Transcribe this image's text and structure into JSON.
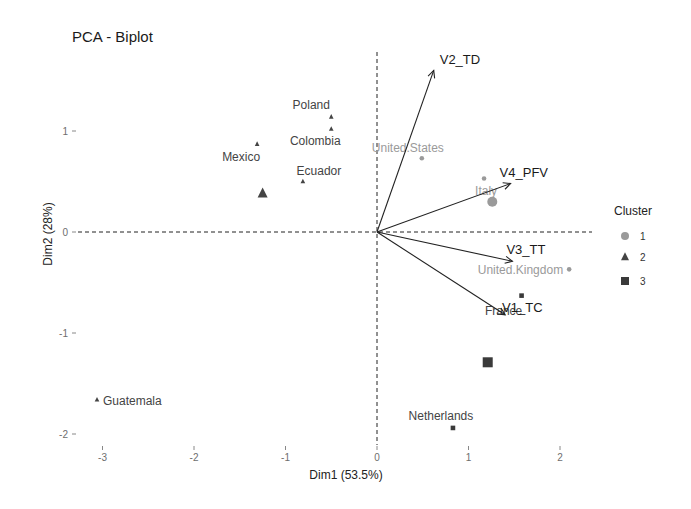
{
  "chart_data": {
    "type": "scatter",
    "title": "PCA - Biplot",
    "xlabel": "Dim1 (53.5%)",
    "ylabel": "Dim2 (28%)",
    "xlim": [
      -3.2,
      2.5
    ],
    "ylim": [
      -2.1,
      1.8
    ],
    "x_ticks": [
      -3,
      -2,
      -1,
      0,
      1,
      2
    ],
    "y_ticks": [
      -2,
      -1,
      0,
      1
    ],
    "grid": false,
    "legend": {
      "title": "Cluster",
      "position": "right",
      "entries": [
        {
          "label": "1",
          "shape": "circle",
          "color": "#9a9a9a"
        },
        {
          "label": "2",
          "shape": "triangle",
          "color": "#444444"
        },
        {
          "label": "3",
          "shape": "square",
          "color": "#3a3a3a"
        }
      ]
    },
    "points": [
      {
        "label": "Poland",
        "x": -0.5,
        "y": 1.14,
        "cluster": 2
      },
      {
        "label": "Colombia",
        "x": -0.5,
        "y": 1.02,
        "cluster": 2
      },
      {
        "label": "Mexico",
        "x": -1.31,
        "y": 0.87,
        "cluster": 2
      },
      {
        "label": "Ecuador",
        "x": -0.81,
        "y": 0.5,
        "cluster": 2
      },
      {
        "label": "Guatemala",
        "x": -3.06,
        "y": -1.66,
        "cluster": 2
      },
      {
        "label": "United.States",
        "x": 0.49,
        "y": 0.73,
        "cluster": 1
      },
      {
        "label": "Italy",
        "x": 1.17,
        "y": 0.53,
        "cluster": 1
      },
      {
        "label": "United.Kingdom",
        "x": 2.1,
        "y": -0.37,
        "cluster": 1
      },
      {
        "label": "France",
        "x": 1.58,
        "y": -0.63,
        "cluster": 3
      },
      {
        "label": "Netherlands",
        "x": 0.83,
        "y": -1.94,
        "cluster": 3
      }
    ],
    "centroids": [
      {
        "cluster": 1,
        "x": 1.26,
        "y": 0.3
      },
      {
        "cluster": 2,
        "x": -1.25,
        "y": 0.38
      },
      {
        "cluster": 3,
        "x": 1.21,
        "y": -1.29
      }
    ],
    "variables": [
      {
        "label": "V2_TD",
        "x": 0.62,
        "y": 1.6
      },
      {
        "label": "V4_PFV",
        "x": 1.46,
        "y": 0.48
      },
      {
        "label": "V3_TT",
        "x": 1.48,
        "y": -0.29
      },
      {
        "label": "V1_TC",
        "x": 1.4,
        "y": -0.82
      }
    ]
  }
}
